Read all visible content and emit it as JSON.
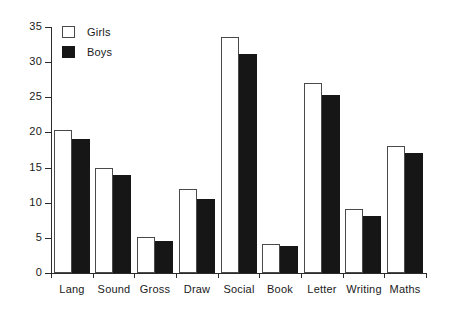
{
  "chart_data": {
    "type": "bar",
    "title": "",
    "subtitle": "",
    "xlabel": "",
    "ylabel": "",
    "ylim": [
      0,
      35
    ],
    "ytick_step": 5,
    "yticks": [
      0,
      5,
      10,
      15,
      20,
      25,
      30,
      35
    ],
    "ytick_labels": [
      "0",
      "5",
      "10",
      "15",
      "20",
      "25",
      "30",
      "35"
    ],
    "grid": false,
    "legend_position": "top-left",
    "categories": [
      "Lang",
      "Sound",
      "Gross",
      "Draw",
      "Social",
      "Book",
      "Letter",
      "Writing",
      "Maths"
    ],
    "series": [
      {
        "name": "Girls",
        "color": "#ffffff",
        "edge_color": "#4a4a4a",
        "values": [
          20.4,
          15.0,
          5.1,
          12.0,
          33.6,
          4.1,
          27.0,
          9.1,
          18.1
        ]
      },
      {
        "name": "Boys",
        "color": "#161616",
        "edge_color": "#161616",
        "values": [
          19.0,
          14.0,
          4.6,
          10.5,
          31.1,
          3.8,
          25.3,
          8.1,
          17.1
        ]
      }
    ]
  },
  "legend": {
    "items": [
      {
        "label": "Girls",
        "swatch": "girls"
      },
      {
        "label": "Boys",
        "swatch": "boys"
      }
    ]
  }
}
